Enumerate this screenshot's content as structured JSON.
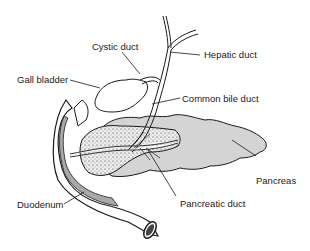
{
  "diagram": {
    "type": "anatomical illustration",
    "labels": {
      "cystic_duct": "Cystic duct",
      "hepatic_duct": "Hepatic duct",
      "gall_bladder": "Gall bladder",
      "common_bile_duct": "Common bile duct",
      "pancreas": "Pancreas",
      "duodenum": "Duodenum",
      "pancreatic_duct": "Pancreatic duct"
    },
    "colors": {
      "outline": "#1a1a1a",
      "pancreas_fill": "#d4d4d4",
      "stippled_head_fill": "#e6e6e6",
      "duodenum_wall": "#a9a9a9",
      "background": "#ffffff"
    }
  }
}
